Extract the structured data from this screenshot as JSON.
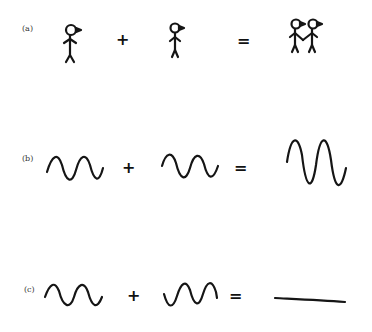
{
  "rows": [
    {
      "label": "(a)",
      "description": "person + person = two people holding hands",
      "plus": "+",
      "equals": "="
    },
    {
      "label": "(b)",
      "description": "wave + in-phase wave = wave with doubled amplitude (constructive interference)",
      "plus": "+",
      "equals": "="
    },
    {
      "label": "(c)",
      "description": "wave + out-of-phase wave = flat line (destructive interference)",
      "plus": "+",
      "equals": "="
    }
  ],
  "colors": {
    "ink": "#151515",
    "background": "#ffffff"
  }
}
